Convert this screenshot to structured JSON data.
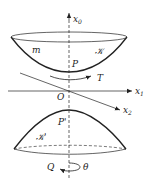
{
  "diagram": {
    "axes": {
      "x0": {
        "label": "x",
        "subscript": "0"
      },
      "x1": {
        "label": "x",
        "subscript": "1"
      },
      "x2": {
        "label": "x",
        "subscript": "2"
      }
    },
    "origin_label": "O",
    "upper_surface": {
      "mass_label": "m",
      "surface_label": "𝒦",
      "point_label": "P",
      "tangent_label": "T"
    },
    "lower_surface": {
      "surface_label": "𝒦'",
      "point_label": "P'",
      "rotation_point_label": "Q",
      "angle_label": "θ"
    },
    "colors": {
      "line": "#222222",
      "background": "#ffffff"
    }
  }
}
